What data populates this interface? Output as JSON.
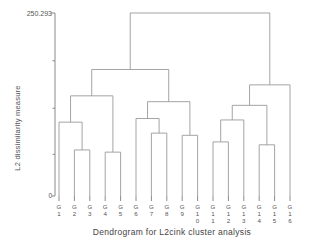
{
  "chart_data": {
    "type": "dendrogram",
    "title": "",
    "xlabel": "Dendrogram for L2cink cluster analysis",
    "ylabel": "L2 dissimilarity measure",
    "ylim": [
      0,
      250.293
    ],
    "ytick_labels": [
      "250.293",
      "0"
    ],
    "ytick_values": [
      250.293,
      0
    ],
    "grid": false,
    "legend": null,
    "leaf_count": 16,
    "categories": [
      "G1",
      "G2",
      "G3",
      "G4",
      "G5",
      "G6",
      "G7",
      "G8",
      "G9",
      "G10",
      "G11",
      "G12",
      "G13",
      "G14",
      "G15",
      "G16"
    ],
    "leaf_labels_stacked": [
      [
        "G",
        "1"
      ],
      [
        "G",
        "2"
      ],
      [
        "G",
        "3"
      ],
      [
        "G",
        "4"
      ],
      [
        "G",
        "5"
      ],
      [
        "G",
        "6"
      ],
      [
        "G",
        "7"
      ],
      [
        "G",
        "8"
      ],
      [
        "G",
        "9"
      ],
      [
        "G",
        "1",
        "0"
      ],
      [
        "G",
        "1",
        "1"
      ],
      [
        "G",
        "1",
        "2"
      ],
      [
        "G",
        "1",
        "3"
      ],
      [
        "G",
        "1",
        "4"
      ],
      [
        "G",
        "1",
        "5"
      ],
      [
        "G",
        "1",
        "6"
      ]
    ],
    "merges": [
      {
        "id": "m1",
        "left": "G2",
        "right": "G3",
        "height": 63.0
      },
      {
        "id": "m2",
        "left": "G1",
        "right": "m1",
        "height": 101.0
      },
      {
        "id": "m3",
        "left": "G4",
        "right": "G5",
        "height": 60.0
      },
      {
        "id": "m4",
        "left": "m2",
        "right": "m3",
        "height": 137.0
      },
      {
        "id": "m5",
        "left": "G7",
        "right": "G8",
        "height": 86.0
      },
      {
        "id": "m6",
        "left": "G6",
        "right": "m5",
        "height": 106.0
      },
      {
        "id": "m7",
        "left": "G9",
        "right": "G10",
        "height": 83.0
      },
      {
        "id": "m8",
        "left": "m6",
        "right": "m7",
        "height": 129.0
      },
      {
        "id": "m9",
        "left": "m4",
        "right": "m8",
        "height": 173.0
      },
      {
        "id": "m10",
        "left": "G11",
        "right": "G12",
        "height": 74.0
      },
      {
        "id": "m11",
        "left": "m10",
        "right": "G13",
        "height": 104.0
      },
      {
        "id": "m12",
        "left": "G14",
        "right": "G15",
        "height": 70.0
      },
      {
        "id": "m13",
        "left": "m11",
        "right": "m12",
        "height": 124.0
      },
      {
        "id": "m14",
        "left": "m13",
        "right": "G16",
        "height": 152.0
      },
      {
        "id": "m15",
        "left": "m9",
        "right": "m14",
        "height": 250.293
      }
    ],
    "axis": {
      "top_value": 250.293,
      "bottom_value": 0,
      "inner_ticks": [
        185.0,
        120.0,
        57.0
      ]
    },
    "colors": {
      "line": "#9a9a9a",
      "axis": "#8a8a8a",
      "text": "#555555",
      "background": "#ffffff"
    }
  }
}
